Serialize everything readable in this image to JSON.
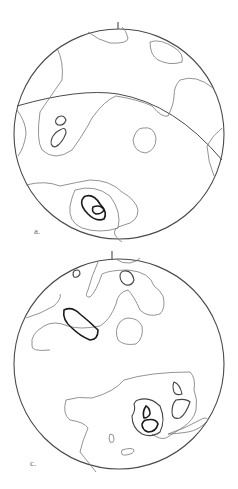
{
  "figure": {
    "panels": [
      {
        "id": "a",
        "label": "a.",
        "type": "stereonet contour plot",
        "north_tick": true,
        "great_circle": true
      },
      {
        "id": "c",
        "label": "c.",
        "type": "stereonet contour plot",
        "north_tick": true,
        "great_circle": false
      }
    ],
    "colors": {
      "outline": "#4a4a4a",
      "low_contour": "#777777",
      "mid_contour": "#444444",
      "high_contour": "#1a1a1a",
      "background": "#ffffff"
    }
  }
}
